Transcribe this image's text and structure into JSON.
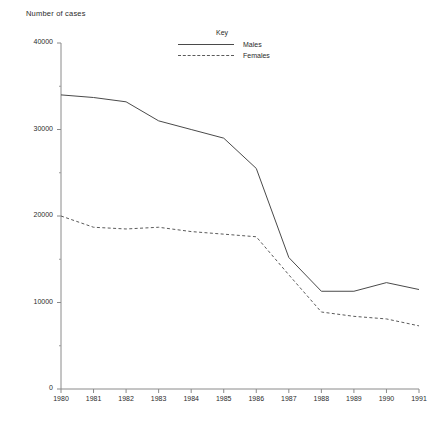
{
  "chart_data": {
    "type": "line",
    "title": "Number of cases",
    "xlabel": "",
    "ylabel": "Number of cases",
    "x": [
      1980,
      1981,
      1982,
      1983,
      1984,
      1985,
      1986,
      1987,
      1988,
      1989,
      1990,
      1991
    ],
    "categories": [
      "1980",
      "1981",
      "1982",
      "1983",
      "1984",
      "1985",
      "1986",
      "1987",
      "1988",
      "1989",
      "1990",
      "1991"
    ],
    "series": [
      {
        "name": "Males",
        "style": "solid",
        "color": "#4a4a4a",
        "values": [
          34000,
          33700,
          33200,
          31000,
          30000,
          29000,
          25500,
          15200,
          11300,
          11300,
          12300,
          11500
        ]
      },
      {
        "name": "Females",
        "style": "dashed",
        "color": "#5a5a5a",
        "values": [
          20000,
          18700,
          18500,
          18700,
          18200,
          17900,
          17600,
          13200,
          8900,
          8400,
          8100,
          7300
        ]
      }
    ],
    "ylim": [
      0,
      40000
    ],
    "xlim": [
      1980,
      1991
    ],
    "ytick_labels": [
      "0",
      "10000",
      "20000",
      "30000",
      "40000"
    ],
    "ytick_values": [
      0,
      10000,
      20000,
      30000,
      40000
    ],
    "yminor_values": [
      5000,
      15000,
      25000,
      35000
    ],
    "grid": false,
    "legend_position": "top-center"
  },
  "legend": {
    "title": "Key",
    "entries": [
      {
        "label": "Males",
        "style": "solid"
      },
      {
        "label": "Females",
        "style": "dashed"
      }
    ]
  }
}
